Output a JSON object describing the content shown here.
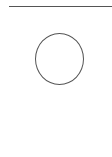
{
  "diagram": {
    "shapes": [
      {
        "type": "line",
        "name": "top-rule",
        "stroke": "#555555"
      },
      {
        "type": "circle",
        "name": "circle",
        "stroke": "#555555",
        "fill": "#ffffff"
      }
    ]
  }
}
